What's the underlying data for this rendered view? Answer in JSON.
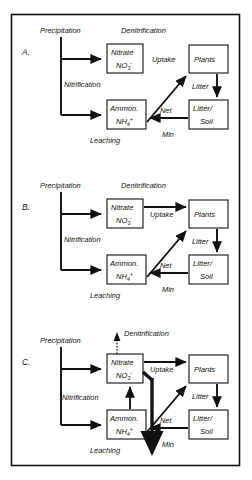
{
  "figure": {
    "background_color": "#ffffff",
    "ink_color": "#111111",
    "panels": [
      {
        "id": "A.",
        "flux_labels": {
          "precipitation": "Precipitation",
          "denitrification": "Denitrification",
          "nitrification": "Nitrification",
          "leaching": "Leaching",
          "uptake": "Uptake",
          "litter": "Litter",
          "net": "Net",
          "min": "Min"
        },
        "boxes": {
          "nitrate_line1": "Nitrate",
          "nitrate_line2": "NO",
          "nitrate_sub": "3",
          "nitrate_sup": "-",
          "ammon_line1": "Ammon.",
          "ammon_line2": "NH",
          "ammon_sub": "4",
          "ammon_sup": "+",
          "plants": "Plants",
          "litter_soil_line1": "Litter/",
          "litter_soil_line2": "Soil"
        }
      },
      {
        "id": "B.",
        "flux_labels": {
          "precipitation": "Precipitation",
          "denitrification": "Denitrification",
          "nitrification": "Nitrification",
          "leaching": "Leaching",
          "uptake": "Uptake",
          "litter": "Litter",
          "net": "Net",
          "min": "Min"
        },
        "boxes": {
          "nitrate_line1": "Nitrate",
          "nitrate_line2": "NO",
          "nitrate_sub": "3",
          "nitrate_sup": "-",
          "ammon_line1": "Ammon.",
          "ammon_line2": "NH",
          "ammon_sub": "4",
          "ammon_sup": "+",
          "plants": "Plants",
          "litter_soil_line1": "Litter/",
          "litter_soil_line2": "Soil"
        }
      },
      {
        "id": "C.",
        "flux_labels": {
          "precipitation": "Precipitation",
          "denitrification": "Denitrification",
          "nitrification": "Nitrification",
          "leaching": "Leaching",
          "uptake": "Uptake",
          "litter": "Litter",
          "net": "Net",
          "min": "Min"
        },
        "boxes": {
          "nitrate_line1": "Nitrate",
          "nitrate_line2": "NO",
          "nitrate_sub": "3",
          "nitrate_sup": "-",
          "ammon_line1": "Ammon.",
          "ammon_line2": "NH",
          "ammon_sub": "4",
          "ammon_sup": "+",
          "plants": "Plants",
          "litter_soil_line1": "Litter/",
          "litter_soil_line2": "Soil"
        }
      }
    ]
  }
}
